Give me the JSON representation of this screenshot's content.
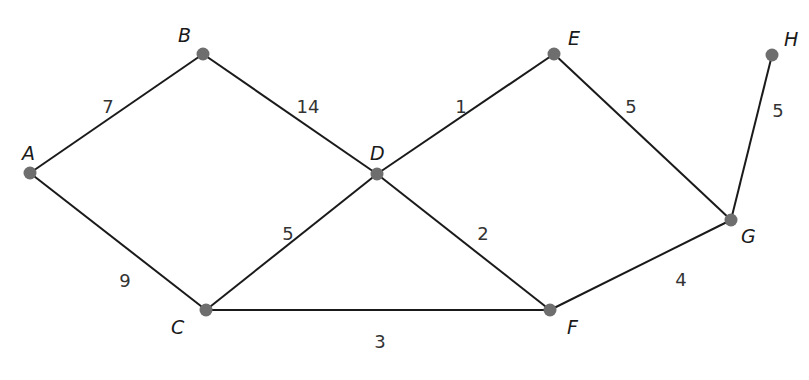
{
  "graph": {
    "title": "",
    "nodes": [
      {
        "id": "A",
        "x": 30,
        "y": 173,
        "lx": 22,
        "ly": 160
      },
      {
        "id": "B",
        "x": 203,
        "y": 54,
        "lx": 178,
        "ly": 42
      },
      {
        "id": "C",
        "x": 206,
        "y": 310,
        "lx": 171,
        "ly": 334
      },
      {
        "id": "D",
        "x": 377,
        "y": 174,
        "lx": 370,
        "ly": 160
      },
      {
        "id": "E",
        "x": 554,
        "y": 54,
        "lx": 568,
        "ly": 45
      },
      {
        "id": "F",
        "x": 550,
        "y": 310,
        "lx": 567,
        "ly": 334
      },
      {
        "id": "G",
        "x": 731,
        "y": 220,
        "lx": 741,
        "ly": 243
      },
      {
        "id": "H",
        "x": 772,
        "y": 55,
        "lx": 784,
        "ly": 46
      }
    ],
    "edges": [
      {
        "from": "A",
        "to": "B",
        "weight": "7",
        "lx": 108,
        "ly": 108
      },
      {
        "from": "B",
        "to": "D",
        "weight": "14",
        "lx": 308,
        "ly": 108
      },
      {
        "from": "A",
        "to": "C",
        "weight": "9",
        "lx": 125,
        "ly": 282
      },
      {
        "from": "D",
        "to": "E",
        "weight": "1",
        "lx": 461,
        "ly": 108
      },
      {
        "from": "C",
        "to": "D",
        "weight": "5",
        "lx": 288,
        "ly": 235
      },
      {
        "from": "D",
        "to": "F",
        "weight": "2",
        "lx": 483,
        "ly": 235
      },
      {
        "from": "C",
        "to": "F",
        "weight": "3",
        "lx": 380,
        "ly": 343
      },
      {
        "from": "E",
        "to": "G",
        "weight": "5",
        "lx": 631,
        "ly": 108
      },
      {
        "from": "F",
        "to": "G",
        "weight": "4",
        "lx": 681,
        "ly": 281
      },
      {
        "from": "G",
        "to": "H",
        "weight": "5",
        "lx": 778,
        "ly": 112
      }
    ],
    "node_color": "#6e6e6e",
    "edge_color": "#1a1a1a"
  }
}
